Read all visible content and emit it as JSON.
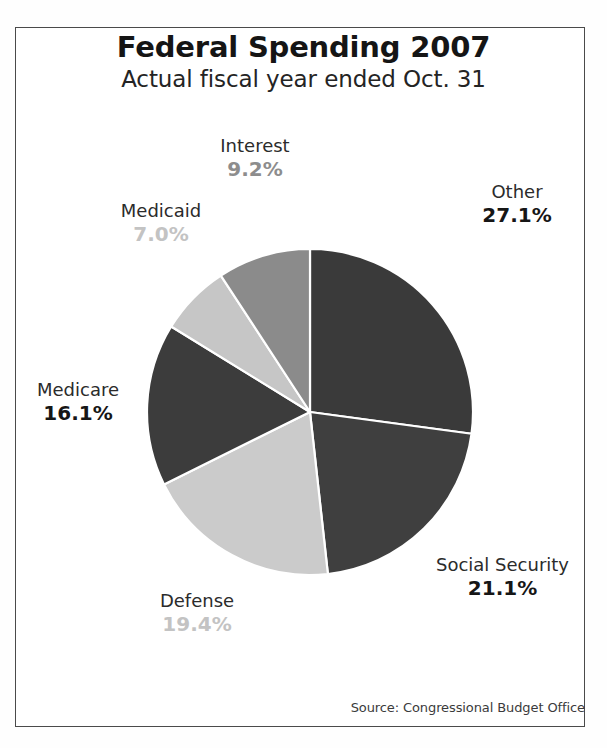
{
  "header": {
    "title": "Federal Spending 2007",
    "subtitle": "Actual fiscal year ended Oct. 31"
  },
  "footer": {
    "source": "Source: Congressional Budget Office"
  },
  "chart_data": {
    "type": "pie",
    "title": "Federal Spending 2007",
    "subtitle": "Actual fiscal year ended Oct. 31",
    "xlabel": "",
    "ylabel": "",
    "units": "percent",
    "legend_position": "outside-labels",
    "grid": false,
    "start_angle_deg": 0,
    "direction": "clockwise",
    "categories": [
      "Other",
      "Social Security",
      "Defense",
      "Medicare",
      "Medicaid",
      "Interest"
    ],
    "values": [
      27.1,
      21.1,
      19.4,
      16.1,
      7.0,
      9.2
    ],
    "value_labels": [
      "27.1%",
      "21.1%",
      "19.4%",
      "16.1%",
      "7.0%",
      "9.2%"
    ],
    "colors": [
      "#3a3a3a",
      "#3f3f3f",
      "#cbcbcb",
      "#3c3c3c",
      "#c6c6c6",
      "#8b8b8b"
    ],
    "slice_edge_color": "#ffffff",
    "slices": [
      {
        "name": "Other",
        "value": 27.1,
        "label": "Other",
        "pct_text": "27.1%",
        "color": "#3a3a3a",
        "pct_tone": "dark"
      },
      {
        "name": "Social Security",
        "value": 21.1,
        "label": "Social Security",
        "pct_text": "21.1%",
        "color": "#3f3f3f",
        "pct_tone": "dark"
      },
      {
        "name": "Defense",
        "value": 19.4,
        "label": "Defense",
        "pct_text": "19.4%",
        "color": "#cbcbcb",
        "pct_tone": "light"
      },
      {
        "name": "Medicare",
        "value": 16.1,
        "label": "Medicare",
        "pct_text": "16.1%",
        "color": "#3c3c3c",
        "pct_tone": "dark"
      },
      {
        "name": "Medicaid",
        "value": 7.0,
        "label": "Medicaid",
        "pct_text": "7.0%",
        "color": "#c6c6c6",
        "pct_tone": "light"
      },
      {
        "name": "Interest",
        "value": 9.2,
        "label": "Interest",
        "pct_text": "9.2%",
        "color": "#8b8b8b",
        "pct_tone": "mid"
      }
    ]
  }
}
